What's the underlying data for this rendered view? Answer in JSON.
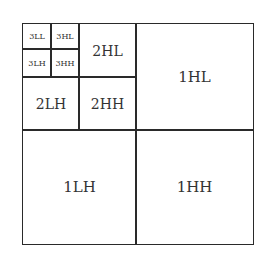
{
  "diagram": {
    "type": "wavelet-subband-decomposition",
    "levels": 3,
    "subbands": {
      "3LL": "3LL",
      "3HL": "3HL",
      "3LH": "3LH",
      "3HH": "3HH",
      "2HL": "2HL",
      "2LH": "2LH",
      "2HH": "2HH",
      "1HL": "1HL",
      "1LH": "1LH",
      "1HH": "1HH"
    },
    "border_color": "#2a2a2a",
    "text_color": "#333333"
  }
}
